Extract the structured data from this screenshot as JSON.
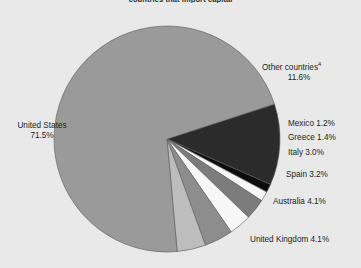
{
  "chart_data": {
    "type": "pie",
    "title": "countries that import capital",
    "categories": [
      "United States",
      "Other countries",
      "Mexico",
      "Greece",
      "Italy",
      "Spain",
      "Australia",
      "United Kingdom"
    ],
    "values": [
      71.5,
      11.6,
      1.2,
      1.4,
      3.0,
      3.2,
      4.1,
      4.1
    ],
    "unit": "%",
    "legend": "none",
    "grid": false,
    "slices": [
      {
        "label": "Other countries",
        "footnote": "4",
        "value": 11.6,
        "value_text": "11.6%",
        "label_text": "Other countries",
        "color": "#2b2b2b"
      },
      {
        "label": "Mexico",
        "footnote": "",
        "value": 1.2,
        "value_text": "1.2%",
        "label_text": "Mexico 1.2%",
        "color": "#0d0d0d"
      },
      {
        "label": "Greece",
        "footnote": "",
        "value": 1.4,
        "value_text": "1.4%",
        "label_text": "Greece 1.4%",
        "color": "#f7f7f7"
      },
      {
        "label": "Italy",
        "footnote": "",
        "value": 3.0,
        "value_text": "3.0%",
        "label_text": "Italy 3.0%",
        "color": "#7c7c7c"
      },
      {
        "label": "Spain",
        "footnote": "",
        "value": 3.2,
        "value_text": "3.2%",
        "label_text": "Spain 3.2%",
        "color": "#f7f7f7"
      },
      {
        "label": "Australia",
        "footnote": "",
        "value": 4.1,
        "value_text": "4.1%",
        "label_text": "Australia 4.1%",
        "color": "#8d8d8d"
      },
      {
        "label": "United Kingdom",
        "footnote": "",
        "value": 4.1,
        "value_text": "4.1%",
        "label_text": "United Kingdom 4.1%",
        "color": "#bdbdbd"
      },
      {
        "label": "United States",
        "footnote": "",
        "value": 71.5,
        "value_text": "71.5%",
        "label_text": "United States",
        "color": "#9a9a9a"
      }
    ]
  },
  "labels": {
    "other_countries_name": "Other countries",
    "other_countries_sup": "4",
    "other_countries_value": "11.6%",
    "mexico": "Mexico 1.2%",
    "greece": "Greece 1.4%",
    "italy": "Italy 3.0%",
    "spain": "Spain 3.2%",
    "australia": "Australia 4.1%",
    "united_kingdom": "United Kingdom 4.1%",
    "united_states_name": "United States",
    "united_states_value": "71.5%"
  },
  "title": "countries that import capital",
  "colors": {
    "background": "#e9e9e9",
    "outline": "#5a5a5a",
    "text": "#1d1d1d"
  }
}
